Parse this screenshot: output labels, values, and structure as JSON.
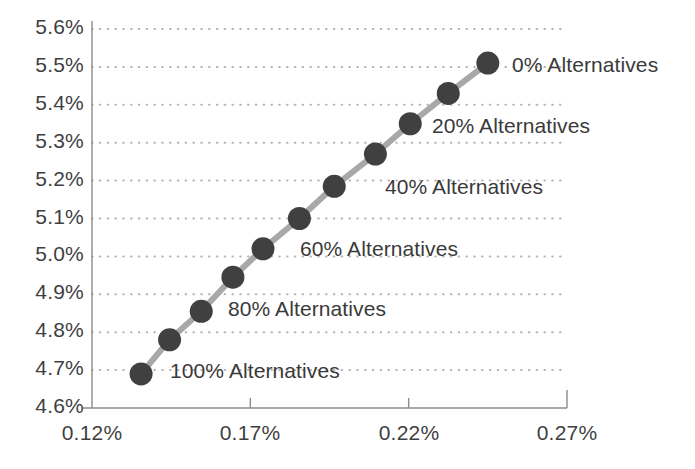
{
  "chart_data": {
    "type": "scatter",
    "title": "",
    "xlabel": "",
    "ylabel": "",
    "grid": true,
    "legend_position": "inline-annotations",
    "xlim": [
      0.12,
      0.27
    ],
    "ylim": [
      4.6,
      5.6
    ],
    "x_ticks": [
      "0.12%",
      "0.17%",
      "0.22%",
      "0.27%"
    ],
    "x_tick_values": [
      0.12,
      0.17,
      0.22,
      0.27
    ],
    "y_ticks": [
      "5.6%",
      "5.5%",
      "5.4%",
      "5.3%",
      "5.2%",
      "5.1%",
      "5.0%",
      "4.9%",
      "4.8%",
      "4.7%",
      "4.6%"
    ],
    "y_tick_values": [
      5.6,
      5.5,
      5.4,
      5.3,
      5.2,
      5.1,
      5.0,
      4.9,
      4.8,
      4.7,
      4.6
    ],
    "series_name": "Efficient frontier",
    "marker_color": "#404040",
    "line_color": "#a8a8a8",
    "grid_color": "#b4b4b4",
    "axis_color": "#8c8c8c",
    "points": [
      {
        "label": "100% Alternatives",
        "x": 0.1355,
        "y": 4.69,
        "annotated": true
      },
      {
        "label": "90% Alternatives",
        "x": 0.1445,
        "y": 4.78,
        "annotated": false
      },
      {
        "label": "80% Alternatives",
        "x": 0.1545,
        "y": 4.855,
        "annotated": true
      },
      {
        "label": "70% Alternatives",
        "x": 0.1645,
        "y": 4.945,
        "annotated": false
      },
      {
        "label": "60% Alternatives",
        "x": 0.174,
        "y": 5.02,
        "annotated": true
      },
      {
        "label": "50% Alternatives",
        "x": 0.1855,
        "y": 5.1,
        "annotated": false
      },
      {
        "label": "40% Alternatives",
        "x": 0.1965,
        "y": 5.185,
        "annotated": true
      },
      {
        "label": "30% Alternatives",
        "x": 0.2095,
        "y": 5.27,
        "annotated": false
      },
      {
        "label": "20% Alternatives",
        "x": 0.2205,
        "y": 5.35,
        "annotated": true
      },
      {
        "label": "10% Alternatives",
        "x": 0.2325,
        "y": 5.43,
        "annotated": false
      },
      {
        "label": "0% Alternatives",
        "x": 0.245,
        "y": 5.51,
        "annotated": true
      }
    ],
    "annotations": [
      {
        "text": "0% Alternatives",
        "px": 512,
        "py": 66
      },
      {
        "text": "20% Alternatives",
        "px": 432,
        "py": 127
      },
      {
        "text": "40% Alternatives",
        "px": 385,
        "py": 188
      },
      {
        "text": "60% Alternatives",
        "px": 300,
        "py": 250
      },
      {
        "text": "80% Alternatives",
        "px": 228,
        "py": 310
      },
      {
        "text": "100% Alternatives",
        "px": 170,
        "py": 372
      }
    ]
  },
  "axes": {
    "y_labels": [
      {
        "text": "5.6%",
        "py": 29
      },
      {
        "text": "5.5%",
        "py": 67
      },
      {
        "text": "5.4%",
        "py": 105
      },
      {
        "text": "5.3%",
        "py": 143
      },
      {
        "text": "5.2%",
        "py": 181
      },
      {
        "text": "5.1%",
        "py": 219
      },
      {
        "text": "5.0%",
        "py": 256
      },
      {
        "text": "4.9%",
        "py": 294
      },
      {
        "text": "4.8%",
        "py": 332
      },
      {
        "text": "4.7%",
        "py": 370
      },
      {
        "text": "4.6%",
        "py": 408
      }
    ],
    "x_labels": [
      {
        "text": "0.12%",
        "px": 92
      },
      {
        "text": "0.17%",
        "px": 250
      },
      {
        "text": "0.22%",
        "px": 409
      },
      {
        "text": "0.27%",
        "px": 567
      }
    ]
  }
}
